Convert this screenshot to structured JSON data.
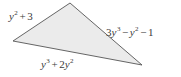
{
  "figure": {
    "type": "triangle-with-side-labels",
    "background_color": "#ffffff",
    "fill_color": "#ebebeb",
    "stroke_color": "#555555",
    "stroke_width": 0.9,
    "vertices": {
      "left": {
        "x": 13,
        "y": 41
      },
      "apex": {
        "x": 70,
        "y": 3
      },
      "right": {
        "x": 142,
        "y": 65
      }
    },
    "polygon_points": "13,41 70,3 142,65"
  },
  "labels": {
    "left_side": {
      "text": "y² + 3",
      "base": "y",
      "exponent": "2",
      "operator": "+",
      "constant": "3",
      "position": "upper-left"
    },
    "right_side": {
      "text": "3y³ − y² − 1",
      "term1_coefficient": "3",
      "term1_base": "y",
      "term1_exponent": "3",
      "operator1": "−",
      "term2_base": "y",
      "term2_exponent": "2",
      "operator2": "−",
      "constant": "1",
      "position": "right"
    },
    "bottom_side": {
      "text": "y³ + 2y²",
      "term1_base": "y",
      "term1_exponent": "3",
      "operator": "+",
      "term2_coefficient": "2",
      "term2_base": "y",
      "term2_exponent": "2",
      "position": "bottom"
    }
  }
}
